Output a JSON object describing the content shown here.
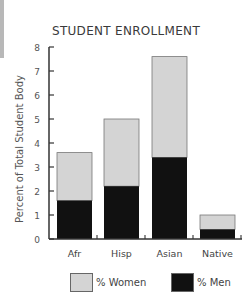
{
  "chart_data": {
    "type": "bar",
    "stacked": true,
    "title": "STUDENT ENROLLMENT",
    "xlabel": "",
    "ylabel": "Percent of Total Student Body",
    "ylim": [
      0,
      8
    ],
    "yticks": [
      0,
      1,
      2,
      3,
      4,
      5,
      6,
      7,
      8
    ],
    "categories": [
      "Afr",
      "Hisp",
      "Asian",
      "Native"
    ],
    "series": [
      {
        "name": "% Men",
        "color": "#111111",
        "values": [
          1.6,
          2.2,
          3.4,
          0.4
        ]
      },
      {
        "name": "% Women",
        "color": "#d4d4d4",
        "values": [
          2.0,
          2.8,
          4.2,
          0.6
        ]
      }
    ],
    "totals": [
      3.6,
      5.0,
      7.6,
      1.0
    ],
    "legend_position": "bottom",
    "grid": false
  },
  "legend": {
    "women_label": "% Women",
    "men_label": "% Men"
  },
  "colors": {
    "women": "#d4d4d4",
    "men": "#111111",
    "axis": "#333333"
  }
}
